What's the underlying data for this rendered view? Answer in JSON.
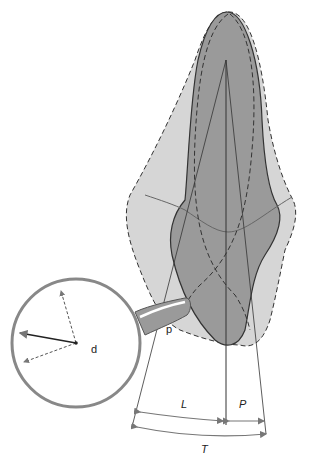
{
  "diagram": {
    "labels": {
      "magnifier_label": "d",
      "handle_label": "p",
      "lingual_width": "L",
      "proximal_width": "P",
      "total_width": "T"
    },
    "colors": {
      "outer_shape": "#d6d6d6",
      "inner_shape": "#9a9a9a",
      "outline": "#333333",
      "dimension_arrows": "#777777",
      "lens_ring": "#888888",
      "background": "#ffffff"
    }
  }
}
